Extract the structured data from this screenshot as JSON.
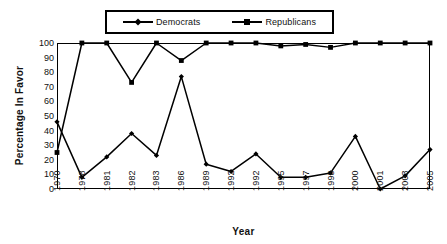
{
  "chart_data": {
    "type": "line",
    "title": "",
    "xlabel": "Year",
    "ylabel": "Percentage In Favor",
    "categories": [
      "1970",
      "1978",
      "1981",
      "1982",
      "1983",
      "1986",
      "1989",
      "1992",
      "1992",
      "1995",
      "1997",
      "1998",
      "2000",
      "2001",
      "2003",
      "2005"
    ],
    "ylim": [
      0,
      100
    ],
    "yticks": [
      0,
      10,
      20,
      30,
      40,
      50,
      60,
      70,
      80,
      90,
      100
    ],
    "grid": "horizontal-and-vertical",
    "legend_position": "top-center",
    "series": [
      {
        "name": "Democrats",
        "marker": "diamond",
        "color": "#000000",
        "values": [
          46,
          8,
          22,
          38,
          23,
          77,
          17,
          12,
          24,
          8,
          8,
          11,
          36,
          0,
          9,
          27
        ]
      },
      {
        "name": "Republicans",
        "marker": "square",
        "color": "#000000",
        "values": [
          25,
          100,
          100,
          73,
          100,
          88,
          100,
          100,
          100,
          98,
          99,
          97,
          100,
          100,
          100,
          100
        ]
      }
    ]
  },
  "legend": {
    "entries": [
      {
        "label": "Democrats",
        "marker": "diamond-marker-icon"
      },
      {
        "label": "Republicans",
        "marker": "square-marker-icon"
      }
    ]
  },
  "axes": {
    "y_title": "Percentage In Favor",
    "x_title": "Year"
  }
}
